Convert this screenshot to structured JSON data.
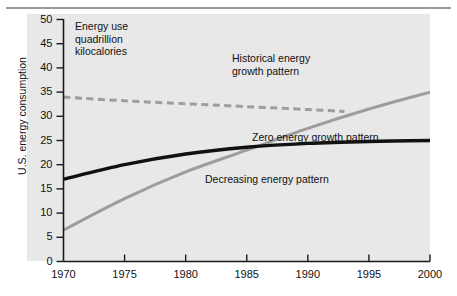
{
  "axes": {
    "y_title": "U.S. energy consumption",
    "y_ticks": [
      "0",
      "5",
      "10",
      "15",
      "20",
      "25",
      "30",
      "35",
      "40",
      "45",
      "50"
    ],
    "x_ticks": [
      "1970",
      "1975",
      "1980",
      "1985",
      "1990",
      "1995",
      "2000"
    ]
  },
  "annotations": {
    "units_caption": "Energy use\nquadrillion\nkilocalories",
    "historical": "Historical energy\ngrowth pattern",
    "zero": "Zero energy growth pattern",
    "decreasing": "Decreasing energy pattern"
  },
  "colors": {
    "panel": "#e8e8e8",
    "rule": "#9a9a9a",
    "axis": "#1a1a1a",
    "historical_line": "#9d9d9d",
    "rising_line": "#9d9d9d",
    "zero_line": "#111111"
  },
  "chart_data": {
    "type": "line",
    "title": "",
    "xlabel": "",
    "ylabel": "U.S. energy consumption",
    "units_note": "Energy use quadrillion kilocalories",
    "xlim": [
      1970,
      2000
    ],
    "ylim": [
      0,
      50
    ],
    "xticks": [
      1970,
      1975,
      1980,
      1985,
      1990,
      1995,
      2000
    ],
    "yticks": [
      0,
      5,
      10,
      15,
      20,
      25,
      30,
      35,
      40,
      45,
      50
    ],
    "grid": false,
    "legend": "inline-annotations",
    "series": [
      {
        "name": "Historical energy growth pattern",
        "style": "dashed",
        "color": "#9d9d9d",
        "x": [
          1970,
          1975,
          1980,
          1985,
          1990,
          1993
        ],
        "values": [
          34.0,
          33.2,
          32.6,
          32.0,
          31.4,
          31.0
        ]
      },
      {
        "name": "Decreasing energy pattern",
        "style": "solid",
        "color": "#9d9d9d",
        "x": [
          1970,
          1975,
          1980,
          1985,
          1990,
          1995,
          2000
        ],
        "values": [
          6.5,
          13.0,
          18.5,
          23.0,
          27.5,
          31.5,
          35.0
        ]
      },
      {
        "name": "Zero energy growth pattern",
        "style": "solid-bold",
        "color": "#111111",
        "x": [
          1970,
          1975,
          1980,
          1985,
          1990,
          1995,
          2000
        ],
        "values": [
          17.0,
          20.0,
          22.2,
          23.6,
          24.4,
          24.8,
          25.0
        ]
      }
    ]
  }
}
